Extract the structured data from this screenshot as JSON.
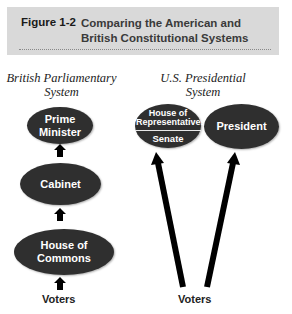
{
  "header": {
    "figure_label": "Figure 1-2",
    "title": "Comparing the American and British Constitutional Systems",
    "background": "#d9d9d9"
  },
  "british": {
    "title": "British Parliamentary System",
    "nodes": [
      {
        "label": "Prime Minister"
      },
      {
        "label": "Cabinet"
      },
      {
        "label": "House of Commons"
      }
    ],
    "voters": "Voters"
  },
  "us": {
    "title": "U.S. Presidential System",
    "congress": {
      "top": "House of Representatives",
      "bottom": "Senate"
    },
    "president": "President",
    "voters": "Voters"
  },
  "colors": {
    "node_fill": "#2f2f2f",
    "node_text": "#ffffff",
    "arrow": "#000000"
  }
}
